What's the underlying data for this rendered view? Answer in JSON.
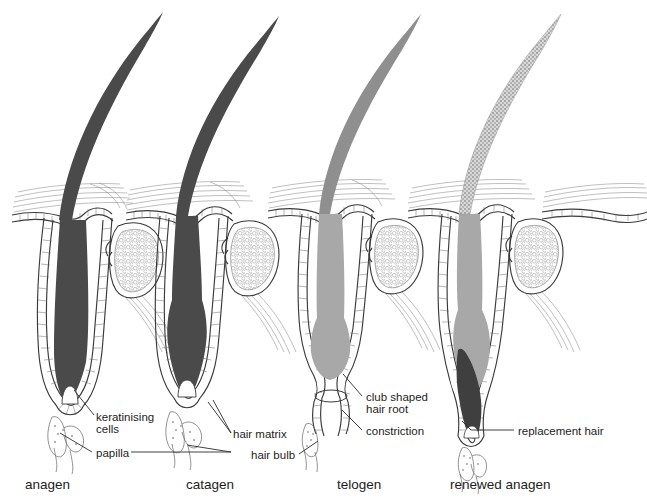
{
  "figure": {
    "width": 647,
    "height": 504,
    "background": "#ffffff"
  },
  "colors": {
    "hair_dark": "#4a4a4a",
    "hair_mid": "#6e6e6e",
    "hair_light": "#a8a8a8",
    "hair_speckled": "#9a9a9a",
    "outline": "#3a3a3a",
    "thin_line": "#6e6e6e",
    "text": "#1d1d1d",
    "leader": "#2b2b2b",
    "sebaceous_fill": "#ffffff"
  },
  "stages": [
    {
      "id": "anagen",
      "label": "anagen",
      "x": 25,
      "y": 489
    },
    {
      "id": "catagen",
      "label": "catagen",
      "x": 186,
      "y": 489
    },
    {
      "id": "telogen",
      "label": "telogen",
      "x": 337,
      "y": 489
    },
    {
      "id": "renewed-anagen",
      "label": "renewed anagen",
      "x": 450,
      "y": 489
    }
  ],
  "annotations": [
    {
      "id": "keratinising-cells",
      "line1": "keratinising",
      "line2": "cells",
      "x": 96,
      "y": 421,
      "leader": "M 94,417 L 76,391"
    },
    {
      "id": "papilla",
      "line1": "papilla",
      "line2": "",
      "x": 96,
      "y": 457,
      "leader": "M 92,453 L 62,434"
    },
    {
      "id": "hair-matrix",
      "line1": "hair matrix",
      "line2": "",
      "x": 233,
      "y": 438,
      "leader": "M 230,434 L 210,404"
    },
    {
      "id": "hair-bulb",
      "line1": "hair bulb",
      "line2": "",
      "x": 251,
      "y": 459,
      "leader": "M 300,455 L 318,443"
    },
    {
      "id": "club-shaped-hair-root",
      "line1": "club shaped",
      "line2": "hair root",
      "x": 366,
      "y": 401,
      "leader": "M 363,398 L 345,375"
    },
    {
      "id": "constriction",
      "line1": "constriction",
      "line2": "",
      "x": 366,
      "y": 435,
      "leader": "M 363,431 L 344,414"
    },
    {
      "id": "replacement-hair",
      "line1": "replacement hair",
      "line2": "",
      "x": 518,
      "y": 435,
      "leader": "M 514,431 L 470,431"
    }
  ],
  "papilla_label_connector": "M 128,453 L 232,453 L 262,434",
  "structures": [
    {
      "id": "follicle-anagen",
      "stage": "anagen",
      "hair_root_color": "#4a4a4a",
      "shaft_color": "#4a4a4a"
    },
    {
      "id": "follicle-catagen",
      "stage": "catagen",
      "hair_root_color": "#4a4a4a",
      "shaft_color": "#4a4a4a"
    },
    {
      "id": "follicle-telogen",
      "stage": "telogen",
      "hair_root_color": "#a8a8a8",
      "shaft_color": "#8f8f8f"
    },
    {
      "id": "follicle-renewed-anagen",
      "stage": "renewed anagen",
      "hair_root_color": "#a8a8a8",
      "shaft_color": "#9a9a9a",
      "new_hair_color": "#3f3f3f"
    }
  ]
}
